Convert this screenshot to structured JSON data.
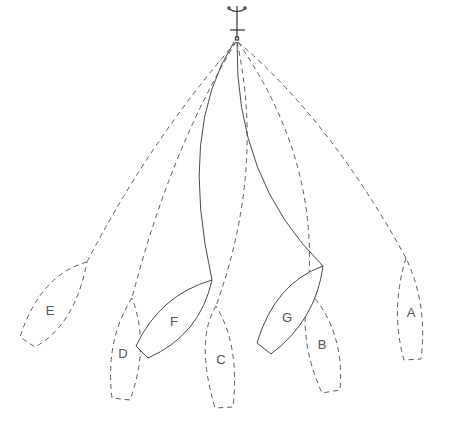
{
  "diagram": {
    "anchor_icon": "anchor-icon",
    "boats": [
      {
        "id": "E",
        "label": "E",
        "style": "dashed"
      },
      {
        "id": "D",
        "label": "D",
        "style": "dashed"
      },
      {
        "id": "F",
        "label": "F",
        "style": "solid"
      },
      {
        "id": "C",
        "label": "C",
        "style": "dashed"
      },
      {
        "id": "G",
        "label": "G",
        "style": "solid"
      },
      {
        "id": "B",
        "label": "B",
        "style": "dashed"
      },
      {
        "id": "A",
        "label": "A",
        "style": "dashed"
      }
    ]
  }
}
